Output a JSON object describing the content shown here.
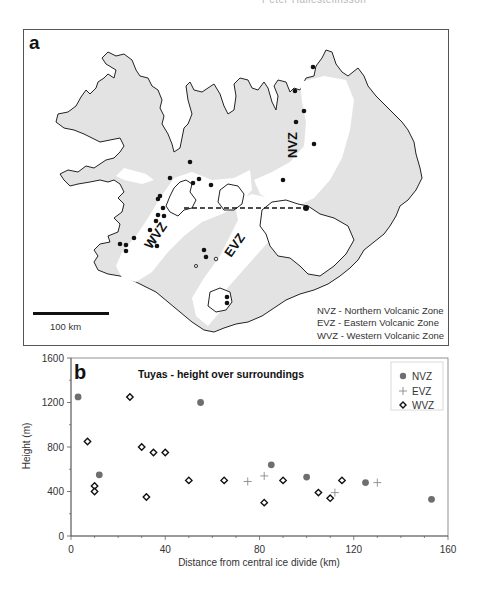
{
  "header_cut_text": "Peter Hallesteiinsson",
  "panel_a": {
    "letter": "a",
    "zone_labels": {
      "nvz": "NVZ",
      "evz": "EVZ",
      "wvz": "WVZ"
    },
    "scale_bar": {
      "label": "100 km"
    },
    "legend": [
      {
        "abbr": "NVZ",
        "text": "NVZ  -  Northern Volcanic Zone"
      },
      {
        "abbr": "EVZ",
        "text": "EVZ  -  Eastern Volcanic Zone"
      },
      {
        "abbr": "WVZ",
        "text": "WVZ  -  Western Volcanic Zone"
      }
    ],
    "colors": {
      "land": "#e3e3e3",
      "volcanic_zone": "#ffffff",
      "coast": "#222222",
      "tuya": "#111111"
    }
  },
  "chart_data": {
    "type": "scatter",
    "panel_letter": "b",
    "title": "Tuyas - height over surroundings",
    "xlabel": "Distance from central ice divide (km)",
    "ylabel": "Height  (m)",
    "xlim": [
      0,
      160
    ],
    "ylim": [
      0,
      1600
    ],
    "xticks": [
      0,
      40,
      80,
      120,
      160
    ],
    "yticks": [
      0,
      400,
      800,
      1200,
      1600
    ],
    "grid": false,
    "legend_position": "upper right",
    "series": [
      {
        "name": "NVZ",
        "marker": "filled-circle",
        "color": "#6e6e6e",
        "points": [
          [
            3,
            1250
          ],
          [
            12,
            550
          ],
          [
            55,
            1200
          ],
          [
            85,
            640
          ],
          [
            100,
            530
          ],
          [
            125,
            480
          ],
          [
            153,
            330
          ]
        ]
      },
      {
        "name": "EVZ",
        "marker": "plus",
        "color": "#8a8a8a",
        "points": [
          [
            75,
            490
          ],
          [
            82,
            540
          ],
          [
            112,
            390
          ],
          [
            130,
            480
          ]
        ]
      },
      {
        "name": "WVZ",
        "marker": "open-diamond",
        "color": "#111111",
        "points": [
          [
            7,
            850
          ],
          [
            10,
            450
          ],
          [
            10,
            400
          ],
          [
            25,
            1250
          ],
          [
            30,
            800
          ],
          [
            32,
            350
          ],
          [
            35,
            750
          ],
          [
            40,
            750
          ],
          [
            50,
            500
          ],
          [
            65,
            500
          ],
          [
            82,
            300
          ],
          [
            90,
            500
          ],
          [
            105,
            390
          ],
          [
            110,
            340
          ],
          [
            115,
            500
          ]
        ]
      }
    ]
  }
}
